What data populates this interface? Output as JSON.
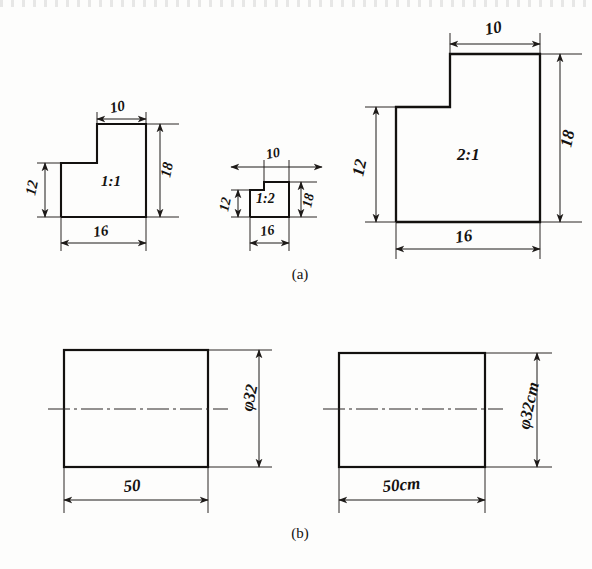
{
  "figure": {
    "title_visible": false,
    "panels": [
      {
        "caption": "(a)",
        "caption_x": 300,
        "caption_y": 279,
        "description": "Three L-shaped step profiles drawn at different scales",
        "shapes": [
          {
            "name": "shape-scale-1-1",
            "scale_label": "1:1",
            "label_x": 101,
            "label_y": 186,
            "outline": "61,217 61,163 97,163 97,124 146,124 146,217",
            "dimensions": [
              {
                "name": "width-top",
                "value": "10",
                "orientation": "horizontal",
                "text_x": 111,
                "text_y": 113,
                "line_y": 119,
                "x1": 97,
                "x2": 146,
                "ext": [
                  {
                    "x": 97,
                    "y1": 124,
                    "y2": 113
                  },
                  {
                    "x": 146,
                    "y1": 124,
                    "y2": 113
                  }
                ]
              },
              {
                "name": "height-left",
                "value": "12",
                "orientation": "vertical",
                "text_x": 35,
                "text_y": 196,
                "line_x": 45,
                "y1": 163,
                "y2": 217,
                "ext": [
                  {
                    "y": 163,
                    "x1": 61,
                    "x2": 38
                  },
                  {
                    "y": 217,
                    "x1": 61,
                    "x2": 38
                  }
                ]
              },
              {
                "name": "height-right",
                "value": "18",
                "orientation": "vertical",
                "text_x": 170,
                "text_y": 178,
                "line_x": 160,
                "y1": 124,
                "y2": 217,
                "ext": [
                  {
                    "y": 124,
                    "x1": 146,
                    "x2": 178
                  },
                  {
                    "y": 217,
                    "x1": 146,
                    "x2": 178
                  }
                ]
              },
              {
                "name": "width-bottom",
                "value": "16",
                "orientation": "horizontal",
                "text_x": 94,
                "text_y": 236,
                "line_y": 243,
                "x1": 61,
                "x2": 146,
                "ext": [
                  {
                    "x": 61,
                    "y1": 217,
                    "y2": 250
                  },
                  {
                    "x": 146,
                    "y1": 217,
                    "y2": 250
                  }
                ]
              }
            ]
          },
          {
            "name": "shape-scale-1-2",
            "scale_label": "1:2",
            "label_x": 266,
            "label_y": 202,
            "outline": "250,217 250,190 264,190 264,182 289,182 289,217",
            "dimensions": [
              {
                "name": "width-top",
                "value": "10",
                "orientation": "horizontal",
                "text_x": 267,
                "text_y": 158,
                "line_y": 167,
                "x1": 264,
                "x2": 289,
                "ext": [
                  {
                    "x": 264,
                    "y1": 182,
                    "y2": 161
                  },
                  {
                    "x": 289,
                    "y1": 182,
                    "y2": 161
                  }
                ]
              },
              {
                "name": "height-left",
                "value": "12",
                "orientation": "vertical",
                "text_x": 228,
                "text_y": 210,
                "line_x": 238,
                "y1": 190,
                "y2": 217,
                "ext": [
                  {
                    "y": 190,
                    "x1": 250,
                    "x2": 232
                  },
                  {
                    "y": 217,
                    "x1": 250,
                    "x2": 232
                  }
                ]
              },
              {
                "name": "height-right",
                "value": "18",
                "orientation": "vertical",
                "text_x": 310,
                "text_y": 205,
                "line_x": 301,
                "y1": 182,
                "y2": 217,
                "ext": [
                  {
                    "y": 182,
                    "x1": 289,
                    "x2": 316
                  },
                  {
                    "y": 217,
                    "x1": 289,
                    "x2": 316
                  }
                ]
              },
              {
                "name": "width-bottom",
                "value": "16",
                "orientation": "horizontal",
                "text_x": 264,
                "text_y": 235,
                "line_y": 243,
                "x1": 250,
                "x2": 289,
                "ext": [
                  {
                    "x": 250,
                    "y1": 217,
                    "y2": 250
                  },
                  {
                    "x": 289,
                    "y1": 217,
                    "y2": 250
                  }
                ]
              }
            ]
          },
          {
            "name": "shape-scale-2-1",
            "scale_label": "2:1",
            "label_x": 466,
            "label_y": 158,
            "outline": "396,222 396,107 450,107 450,54 540,54 540,222",
            "dimensions": [
              {
                "name": "width-top",
                "value": "10",
                "orientation": "horizontal",
                "text_x": 486,
                "text_y": 35,
                "line_y": 44,
                "x1": 450,
                "x2": 540,
                "ext": [
                  {
                    "x": 450,
                    "y1": 54,
                    "y2": 38
                  },
                  {
                    "x": 540,
                    "y1": 54,
                    "y2": 38
                  }
                ]
              },
              {
                "name": "height-left",
                "value": "12",
                "orientation": "vertical",
                "text_x": 363,
                "text_y": 177,
                "line_x": 376,
                "y1": 107,
                "y2": 222,
                "ext": [
                  {
                    "y": 107,
                    "x1": 396,
                    "x2": 366
                  },
                  {
                    "y": 222,
                    "x1": 396,
                    "x2": 366
                  }
                ]
              },
              {
                "name": "height-right",
                "value": "18",
                "orientation": "vertical",
                "text_x": 570,
                "text_y": 148,
                "line_x": 560,
                "y1": 54,
                "y2": 222,
                "ext": [
                  {
                    "y": 54,
                    "x1": 540,
                    "x2": 580
                  },
                  {
                    "y": 222,
                    "x1": 540,
                    "x2": 580
                  }
                ]
              },
              {
                "name": "width-bottom",
                "value": "16",
                "orientation": "horizontal",
                "text_x": 460,
                "text_y": 242,
                "line_y": 249,
                "x1": 396,
                "x2": 540,
                "ext": [
                  {
                    "x": 396,
                    "y1": 222,
                    "y2": 258
                  },
                  {
                    "x": 540,
                    "y1": 222,
                    "y2": 258
                  }
                ]
              }
            ]
          }
        ]
      },
      {
        "caption": "(b)",
        "caption_x": 300,
        "caption_y": 538,
        "description": "Two cylinder elevations, one dimensioned without units and one with cm units",
        "shapes": [
          {
            "name": "cylinder-no-units",
            "rect": {
              "x": 64,
              "y": 350,
              "w": 144,
              "h": 117
            },
            "centerline_y": 409,
            "centerline_x1": 48,
            "centerline_x2": 228,
            "dimensions": [
              {
                "name": "diameter",
                "value": "φ32",
                "orientation": "vertical",
                "text_x": 252,
                "text_y": 412,
                "line_x": 259,
                "y1": 350,
                "y2": 467,
                "ext": [
                  {
                    "y": 350,
                    "x1": 208,
                    "x2": 272
                  },
                  {
                    "y": 467,
                    "x1": 208,
                    "x2": 272
                  }
                ]
              },
              {
                "name": "length",
                "value": "50",
                "orientation": "horizontal",
                "text_x": 128,
                "text_y": 492,
                "line_y": 500,
                "x1": 64,
                "x2": 208,
                "ext": [
                  {
                    "x": 64,
                    "y1": 467,
                    "y2": 512
                  },
                  {
                    "x": 208,
                    "y1": 467,
                    "y2": 512
                  }
                ]
              }
            ]
          },
          {
            "name": "cylinder-with-units",
            "rect": {
              "x": 339,
              "y": 353,
              "w": 146,
              "h": 114
            },
            "centerline_y": 409,
            "centerline_x1": 323,
            "centerline_x2": 503,
            "dimensions": [
              {
                "name": "diameter",
                "value": "φ32cm",
                "orientation": "vertical",
                "text_x": 528,
                "text_y": 425,
                "line_x": 537,
                "y1": 353,
                "y2": 467,
                "ext": [
                  {
                    "y": 353,
                    "x1": 485,
                    "x2": 552
                  },
                  {
                    "y": 467,
                    "x1": 485,
                    "x2": 552
                  }
                ]
              },
              {
                "name": "length",
                "value": "50cm",
                "orientation": "horizontal",
                "text_x": 388,
                "text_y": 492,
                "line_y": 500,
                "x1": 339,
                "x2": 485,
                "ext": [
                  {
                    "x": 339,
                    "y1": 467,
                    "y2": 512
                  },
                  {
                    "x": 485,
                    "y1": 467,
                    "y2": 512
                  }
                ]
              }
            ]
          }
        ]
      }
    ]
  },
  "colors": {
    "ink": "#141210",
    "paper": "#fdfdfc",
    "line": "#1d1a18"
  }
}
